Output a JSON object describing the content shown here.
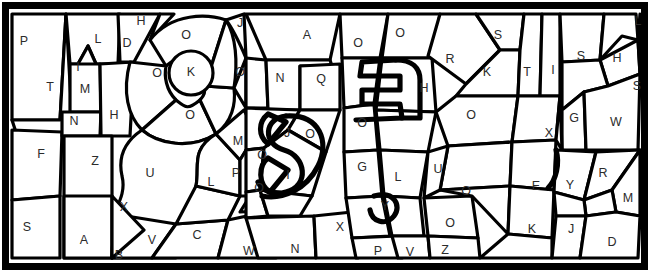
{
  "document": {
    "title": "Color-by-letter mosaic puzzle",
    "type": "coloring-page",
    "width": 650,
    "height": 272,
    "background_color": "#ffffff",
    "line_color": "#000000",
    "label_color": "#2b2b2b",
    "border": {
      "style": "thick-rectangle",
      "stroke_width": 7
    }
  },
  "legend": {
    "distinct_letters": [
      "A",
      "B",
      "C",
      "D",
      "E",
      "F",
      "G",
      "H",
      "I",
      "J",
      "K",
      "L",
      "M",
      "N",
      "O",
      "P",
      "Q",
      "R",
      "S",
      "T",
      "U",
      "V",
      "W",
      "X",
      "Y",
      "Z"
    ],
    "cell_count": 68
  },
  "cells": [
    {
      "id": "c01",
      "letter": "P",
      "x": 24,
      "y": 42
    },
    {
      "id": "c02",
      "letter": "T",
      "x": 50,
      "y": 88
    },
    {
      "id": "c03",
      "letter": "F",
      "x": 41,
      "y": 155
    },
    {
      "id": "c04",
      "letter": "S",
      "x": 27,
      "y": 228
    },
    {
      "id": "c05",
      "letter": "L",
      "x": 98,
      "y": 40
    },
    {
      "id": "c06",
      "letter": "I",
      "x": 78,
      "y": 68
    },
    {
      "id": "c07",
      "letter": "M",
      "x": 85,
      "y": 90
    },
    {
      "id": "c08",
      "letter": "N",
      "x": 74,
      "y": 122
    },
    {
      "id": "c09",
      "letter": "H",
      "x": 114,
      "y": 116
    },
    {
      "id": "c10",
      "letter": "Z",
      "x": 95,
      "y": 162
    },
    {
      "id": "c11",
      "letter": "A",
      "x": 84,
      "y": 241
    },
    {
      "id": "c12",
      "letter": "D",
      "x": 127,
      "y": 44
    },
    {
      "id": "c13",
      "letter": "H",
      "x": 141,
      "y": 22
    },
    {
      "id": "c14",
      "letter": "O",
      "x": 186,
      "y": 36
    },
    {
      "id": "c15",
      "letter": "O",
      "x": 157,
      "y": 74
    },
    {
      "id": "c16",
      "letter": "K",
      "x": 191,
      "y": 73
    },
    {
      "id": "c17",
      "letter": "O",
      "x": 190,
      "y": 116
    },
    {
      "id": "c18",
      "letter": "U",
      "x": 150,
      "y": 174
    },
    {
      "id": "c19",
      "letter": "X",
      "x": 124,
      "y": 208
    },
    {
      "id": "c20",
      "letter": "B",
      "x": 119,
      "y": 256
    },
    {
      "id": "c21",
      "letter": "V",
      "x": 152,
      "y": 241
    },
    {
      "id": "c22",
      "letter": "C",
      "x": 197,
      "y": 236
    },
    {
      "id": "c23",
      "letter": "L",
      "x": 211,
      "y": 183
    },
    {
      "id": "c24",
      "letter": "M",
      "x": 238,
      "y": 142
    },
    {
      "id": "c25",
      "letter": "P",
      "x": 236,
      "y": 174
    },
    {
      "id": "c26",
      "letter": "O",
      "x": 262,
      "y": 156
    },
    {
      "id": "c27",
      "letter": "O",
      "x": 259,
      "y": 189
    },
    {
      "id": "c28",
      "letter": "W",
      "x": 249,
      "y": 252
    },
    {
      "id": "c29",
      "letter": "J",
      "x": 240,
      "y": 24
    },
    {
      "id": "c30",
      "letter": "O",
      "x": 240,
      "y": 73
    },
    {
      "id": "c31",
      "letter": "A",
      "x": 307,
      "y": 36
    },
    {
      "id": "c32",
      "letter": "N",
      "x": 280,
      "y": 79
    },
    {
      "id": "c33",
      "letter": "Q",
      "x": 321,
      "y": 80
    },
    {
      "id": "c34",
      "letter": "J",
      "x": 287,
      "y": 134
    },
    {
      "id": "c35",
      "letter": "O",
      "x": 310,
      "y": 135
    },
    {
      "id": "c36",
      "letter": "I",
      "x": 288,
      "y": 176
    },
    {
      "id": "c37",
      "letter": "N",
      "x": 295,
      "y": 250
    },
    {
      "id": "c38",
      "letter": "X",
      "x": 340,
      "y": 228
    },
    {
      "id": "c39",
      "letter": "O",
      "x": 358,
      "y": 44
    },
    {
      "id": "c40",
      "letter": "O",
      "x": 362,
      "y": 124
    },
    {
      "id": "c41",
      "letter": "G",
      "x": 362,
      "y": 168
    },
    {
      "id": "c42",
      "letter": "P",
      "x": 378,
      "y": 252
    },
    {
      "id": "c43",
      "letter": "O",
      "x": 400,
      "y": 34
    },
    {
      "id": "c44",
      "letter": "H",
      "x": 424,
      "y": 89
    },
    {
      "id": "c45",
      "letter": "L",
      "x": 398,
      "y": 178
    },
    {
      "id": "c46",
      "letter": "Y",
      "x": 385,
      "y": 207
    },
    {
      "id": "c47",
      "letter": "V",
      "x": 410,
      "y": 253
    },
    {
      "id": "c48",
      "letter": "R",
      "x": 450,
      "y": 60
    },
    {
      "id": "c49",
      "letter": "K",
      "x": 487,
      "y": 73
    },
    {
      "id": "c50",
      "letter": "S",
      "x": 498,
      "y": 36
    },
    {
      "id": "c51",
      "letter": "O",
      "x": 471,
      "y": 116
    },
    {
      "id": "c52",
      "letter": "U",
      "x": 438,
      "y": 170
    },
    {
      "id": "c53",
      "letter": "O",
      "x": 466,
      "y": 192
    },
    {
      "id": "c54",
      "letter": "O",
      "x": 450,
      "y": 224
    },
    {
      "id": "c55",
      "letter": "Z",
      "x": 445,
      "y": 251
    },
    {
      "id": "c56",
      "letter": "T",
      "x": 527,
      "y": 73
    },
    {
      "id": "c57",
      "letter": "I",
      "x": 553,
      "y": 71
    },
    {
      "id": "c58",
      "letter": "S",
      "x": 581,
      "y": 57
    },
    {
      "id": "c59",
      "letter": "H",
      "x": 617,
      "y": 59
    },
    {
      "id": "c60",
      "letter": "L",
      "x": 638,
      "y": 22
    },
    {
      "id": "c61",
      "letter": "S",
      "x": 637,
      "y": 87
    },
    {
      "id": "c62",
      "letter": "G",
      "x": 574,
      "y": 119
    },
    {
      "id": "c63",
      "letter": "W",
      "x": 616,
      "y": 123
    },
    {
      "id": "c64",
      "letter": "X",
      "x": 549,
      "y": 134
    },
    {
      "id": "c65",
      "letter": "E",
      "x": 536,
      "y": 187
    },
    {
      "id": "c66",
      "letter": "K",
      "x": 532,
      "y": 230
    },
    {
      "id": "c67",
      "letter": "Y",
      "x": 570,
      "y": 186
    },
    {
      "id": "c68",
      "letter": "J",
      "x": 571,
      "y": 230
    },
    {
      "id": "c69",
      "letter": "R",
      "x": 603,
      "y": 174
    },
    {
      "id": "c70",
      "letter": "M",
      "x": 628,
      "y": 199
    },
    {
      "id": "c71",
      "letter": "D",
      "x": 612,
      "y": 243
    }
  ]
}
